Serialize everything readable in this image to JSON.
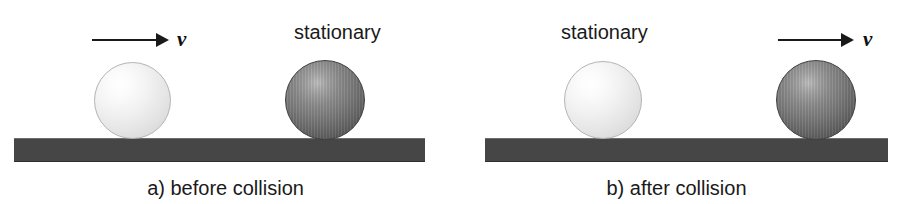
{
  "figure": {
    "width": 902,
    "height": 204,
    "background": "#ffffff"
  },
  "colors": {
    "ground": "#464646",
    "ball_light": "#e6e6e6",
    "ball_dark": "#777777",
    "text": "#1a1a1a",
    "arrow": "#1a1a1a"
  },
  "panels": [
    {
      "id": "a",
      "caption": "a) before collision",
      "ground_label": "ground-surface-a",
      "arrow": {
        "label": "v",
        "direction": "right",
        "attached_to": "light-ball"
      },
      "balls": [
        {
          "name": "light-ball",
          "shade": "light",
          "state_label": "",
          "moving": true
        },
        {
          "name": "dark-ball",
          "shade": "dark",
          "state_label": "stationary",
          "moving": false
        }
      ]
    },
    {
      "id": "b",
      "caption": "b) after collision",
      "ground_label": "ground-surface-b",
      "arrow": {
        "label": "v",
        "direction": "right",
        "attached_to": "dark-ball"
      },
      "balls": [
        {
          "name": "light-ball",
          "shade": "light",
          "state_label": "stationary",
          "moving": false
        },
        {
          "name": "dark-ball",
          "shade": "dark",
          "state_label": "",
          "moving": true
        }
      ]
    }
  ]
}
